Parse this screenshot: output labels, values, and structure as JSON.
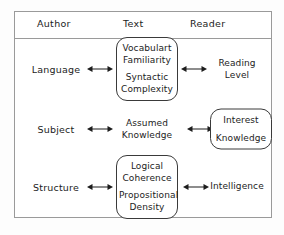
{
  "diagram": {
    "columns": [
      {
        "label": "Author"
      },
      {
        "label": "Text"
      },
      {
        "label": "Reader"
      }
    ],
    "rows": [
      {
        "author": "Language",
        "text_box": {
          "boxed": true,
          "group_a": [
            "Vocabulart",
            "Familiarity"
          ],
          "group_b": [
            "Syntactic",
            "Complexity"
          ]
        },
        "reader_box": {
          "boxed": false,
          "group_a": [
            "Reading",
            "Level"
          ],
          "group_b": []
        },
        "arrow_left": "double-arrow",
        "arrow_right": "double-arrow"
      },
      {
        "author": "Subject",
        "text_box": {
          "boxed": false,
          "group_a": [
            "Assumed",
            "Knowledge"
          ],
          "group_b": []
        },
        "reader_box": {
          "boxed": true,
          "group_a": [
            "Interest"
          ],
          "group_b": [
            "Knowledge"
          ]
        },
        "arrow_left": "double-arrow",
        "arrow_right": "double-arrow"
      },
      {
        "author": "Structure",
        "text_box": {
          "boxed": true,
          "group_a": [
            "Logical",
            "Coherence"
          ],
          "group_b": [
            "Propositional",
            "Density"
          ]
        },
        "reader_box": {
          "boxed": false,
          "group_a": [
            "Intelligence"
          ],
          "group_b": []
        },
        "arrow_left": "double-arrow",
        "arrow_right": "double-arrow"
      }
    ],
    "colors": {
      "ink": "#1c1c1c",
      "frame": "#9a9a9a",
      "box_outline": "#3a3a3a",
      "background": "#ffffff"
    }
  }
}
